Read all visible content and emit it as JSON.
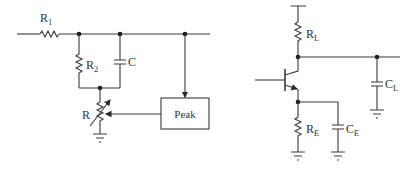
{
  "diagram": {
    "left_circuit": {
      "components": [
        {
          "id": "R1",
          "type": "resistor",
          "label": "R",
          "subscript": "1"
        },
        {
          "id": "R2",
          "type": "resistor",
          "label": "R",
          "subscript": "2"
        },
        {
          "id": "C",
          "type": "capacitor",
          "label": "C"
        },
        {
          "id": "R",
          "type": "variable-resistor",
          "label": "R"
        },
        {
          "id": "Peak",
          "type": "block",
          "label": "Peak"
        }
      ]
    },
    "right_circuit": {
      "components": [
        {
          "id": "RL",
          "type": "resistor",
          "label": "R",
          "subscript": "L"
        },
        {
          "id": "CL",
          "type": "capacitor",
          "label": "C",
          "subscript": "L"
        },
        {
          "id": "Q",
          "type": "npn-transistor",
          "label": ""
        },
        {
          "id": "RE",
          "type": "resistor",
          "label": "R",
          "subscript": "E"
        },
        {
          "id": "CE",
          "type": "capacitor",
          "label": "C",
          "subscript": "E"
        }
      ]
    }
  },
  "colors": {
    "wire": "#3a3a3a",
    "node": "#1a1a1a",
    "background": "#ffffff"
  }
}
